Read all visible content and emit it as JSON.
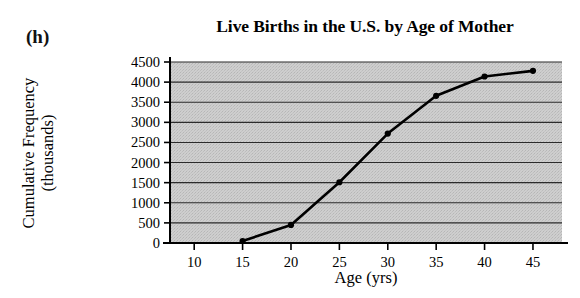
{
  "panel": {
    "label": "(h)"
  },
  "chart_data": {
    "type": "line",
    "title": "Live Births in the U.S. by Age of Mother",
    "xlabel": "Age (yrs)",
    "ylabel": "Cumulative Frequency",
    "ylabel_line1": "Cumulative Frequency",
    "ylabel_line2": "(thousands)",
    "xlim": [
      7.5,
      48
    ],
    "ylim": [
      0,
      4500
    ],
    "xticks": [
      10,
      15,
      20,
      25,
      30,
      35,
      40,
      45
    ],
    "xtick_labels": [
      "10",
      "15",
      "20",
      "25",
      "30",
      "35",
      "40",
      "45"
    ],
    "yticks": [
      0,
      500,
      1000,
      1500,
      2000,
      2500,
      3000,
      3500,
      4000,
      4500
    ],
    "ytick_labels": [
      "0",
      "500",
      "1000",
      "1500",
      "2000",
      "2500",
      "3000",
      "3500",
      "4000",
      "4500"
    ],
    "grid": "horizontal",
    "legend": "none",
    "plot_background": "#c9c9c9",
    "line_color": "#000000",
    "marker": "circle",
    "x": [
      15,
      20,
      25,
      30,
      35,
      40,
      45
    ],
    "values": [
      50,
      450,
      1510,
      2720,
      3660,
      4140,
      4280
    ],
    "series": [
      {
        "name": "Cumulative live births",
        "x": [
          15,
          20,
          25,
          30,
          35,
          40,
          45
        ],
        "values": [
          50,
          450,
          1510,
          2720,
          3660,
          4140,
          4280
        ]
      }
    ]
  }
}
